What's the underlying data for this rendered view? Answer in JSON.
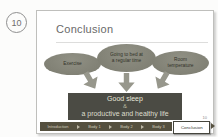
{
  "marker": {
    "value": "10"
  },
  "slide": {
    "title": "Conclusion",
    "bubbles": [
      {
        "label": "Exercise"
      },
      {
        "label": "Going to bed at a regular time"
      },
      {
        "label": "Room temperature"
      }
    ],
    "result_box": {
      "line1": "Good sleep",
      "line2": "&",
      "line3": "a productive and healthy life"
    },
    "slide_number": "10",
    "nav": {
      "items": [
        {
          "label": "Introduction"
        },
        {
          "label": "Body 1"
        },
        {
          "label": "Body 2"
        },
        {
          "label": "Body 3"
        }
      ],
      "active_label": "Conclusion"
    },
    "colors": {
      "bubble_fill": "#84847a",
      "bubble_text": "#33332a",
      "arrow": "#97978c",
      "box_fill": "#4b4b44",
      "box_text": "#e7e7da",
      "nav_fill": "#55503f",
      "nav_text": "#cfcabb",
      "active_bg": "#ffffff",
      "active_border": "#45453d"
    }
  }
}
